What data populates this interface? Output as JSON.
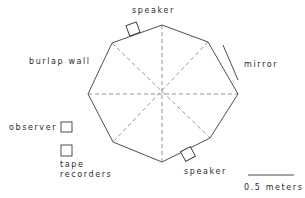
{
  "diagram": {
    "labels": {
      "speaker_top": "speaker",
      "speaker_bottom": "speaker",
      "burlap_wall": "burlap wall",
      "mirror": "mirror",
      "observer": "observer",
      "tape_recorders_line1": "tape",
      "tape_recorders_line2": "recorders",
      "scale": "0.5 meters"
    },
    "colors": {
      "line": "#3a3a3a",
      "dashed": "#7a7a7a",
      "text": "#2a2a2a",
      "background": "#ffffff"
    },
    "octagon_vertices": [
      [
        162,
        25
      ],
      [
        208,
        42
      ],
      [
        238,
        94
      ],
      [
        210,
        138
      ],
      [
        162,
        162
      ],
      [
        113,
        142
      ],
      [
        88,
        94
      ],
      [
        112,
        43
      ]
    ],
    "center": [
      162,
      94
    ]
  }
}
